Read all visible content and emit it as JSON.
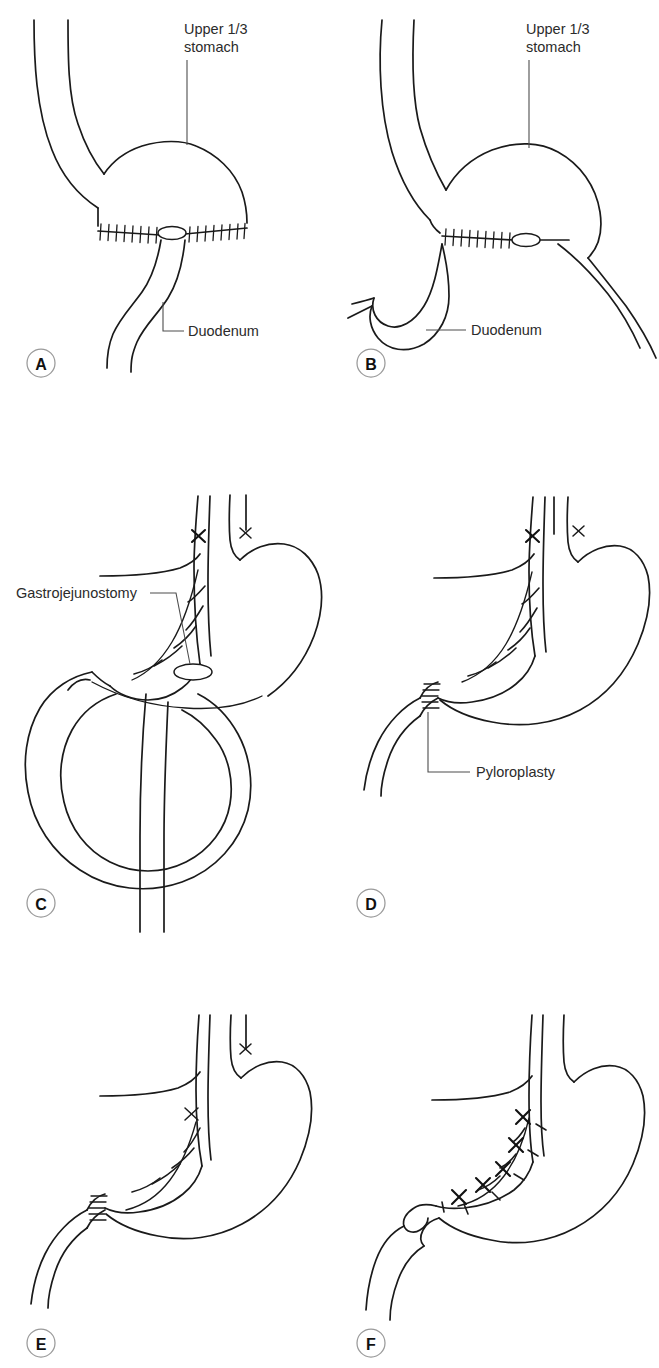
{
  "figure": {
    "background_color": "#ffffff",
    "ink_color": "#1a1a1a",
    "label_color": "#2b2b2b",
    "badge_stroke_color": "#9a9a9a",
    "columns": 2,
    "rows": 3
  },
  "panels": [
    {
      "id": "A",
      "letter": "A",
      "caption": "Subtotal gastrectomy with gastroduodenal anastomosis (Billroth I) — upper one third of stomach remaining",
      "labels": [
        {
          "key": "upper_third",
          "line1": "Upper 1/3",
          "line2": "stomach",
          "leader": "vertical"
        },
        {
          "key": "duodenum",
          "text": "Duodenum",
          "leader": "elbow"
        }
      ],
      "features": [
        "suture-line",
        "stoma-oval",
        "duodenal-stump",
        "esophagus"
      ]
    },
    {
      "id": "B",
      "letter": "B",
      "caption": "Subtotal gastrectomy with gastrojejunal reconstruction — duodenum looping inferiorly",
      "labels": [
        {
          "key": "upper_third",
          "line1": "Upper 1/3",
          "line2": "stomach",
          "leader": "vertical"
        },
        {
          "key": "duodenum",
          "text": "Duodenum",
          "leader": "horizontal"
        }
      ],
      "features": [
        "suture-line",
        "stoma-oval",
        "duodenal-hook",
        "esophagus"
      ]
    },
    {
      "id": "C",
      "letter": "C",
      "caption": "Truncal vagotomy with gastrojejunostomy drainage procedure",
      "labels": [
        {
          "key": "gastrojejunostomy",
          "text": "Gastrojejunostomy",
          "leader": "horizontal"
        }
      ],
      "features": [
        "vagotomy-x-anterior",
        "vagotomy-x-posterior",
        "nerve-branches",
        "jejunal-loop",
        "stoma-oval"
      ]
    },
    {
      "id": "D",
      "letter": "D",
      "caption": "Truncal vagotomy with pyloroplasty drainage procedure",
      "labels": [
        {
          "key": "pyloroplasty",
          "text": "Pyloroplasty",
          "leader": "elbow"
        }
      ],
      "features": [
        "vagotomy-x-anterior",
        "vagotomy-x-posterior",
        "nerve-branches",
        "pyloroplasty-sutures"
      ]
    },
    {
      "id": "E",
      "letter": "E",
      "caption": "Selective vagotomy with pyloroplasty — hepatic and celiac branches preserved",
      "labels": [],
      "features": [
        "vagotomy-x-low-anterior",
        "vagotomy-x-posterior",
        "nerve-branches",
        "pyloroplasty-sutures"
      ]
    },
    {
      "id": "F",
      "letter": "F",
      "caption": "Highly selective (parietal cell) vagotomy — nerves of Latarjet preserved at the antrum",
      "labels": [],
      "features": [
        "multiple-x-marks-lesser-curve",
        "cut-branch-dashes",
        "intact-pylorus"
      ]
    }
  ]
}
